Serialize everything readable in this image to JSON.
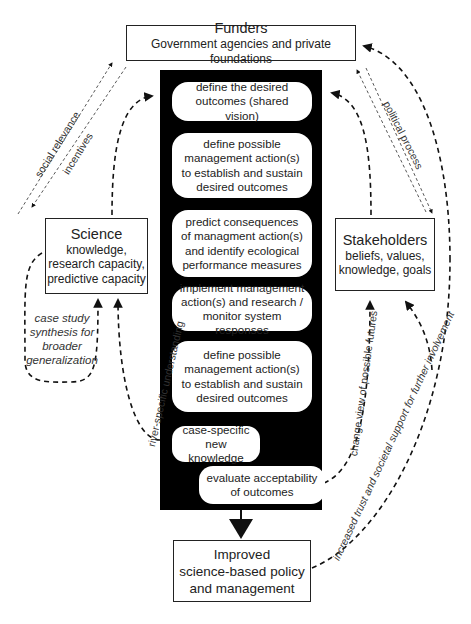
{
  "funders": {
    "title": "Funders",
    "subtitle": "Government agencies and private foundations"
  },
  "science": {
    "title": "Science",
    "lines": [
      "knowledge,",
      "research capacity,",
      "predictive capacity"
    ]
  },
  "stakeholders": {
    "title": "Stakeholders",
    "lines": [
      "beliefs, values,",
      "knowledge, goals"
    ]
  },
  "outcome": {
    "lines": [
      "Improved",
      "science-based policy",
      "and management"
    ]
  },
  "steps": [
    {
      "text": "define the desired\noutcomes (shared vision)"
    },
    {
      "text": "define possible\nmanagement action(s)\nto establish and sustain\ndesired outcomes"
    },
    {
      "text": "predict consequences\nof managment action(s)\nand identify ecological\nperformance measures"
    },
    {
      "text": "implement management\naction(s) and research /\nmonitor system responses"
    },
    {
      "text": "define possible\nmanagement action(s)\nto establish and sustain\ndesired outcomes"
    },
    {
      "text": "case-specific\nnew knowledge"
    },
    {
      "text": "evaluate acceptability\nof outcomes"
    }
  ],
  "edge_labels": {
    "social_relevance": "social relevance",
    "incentives": "incentives",
    "political_process": "political process",
    "case_study": "case study\nsynthesis for\nbroader\ngeneralization",
    "river_specific": "river-specific understanding",
    "change_view": "change view of possible futures",
    "increased_trust": "increased trust and societal support for further involvement"
  }
}
